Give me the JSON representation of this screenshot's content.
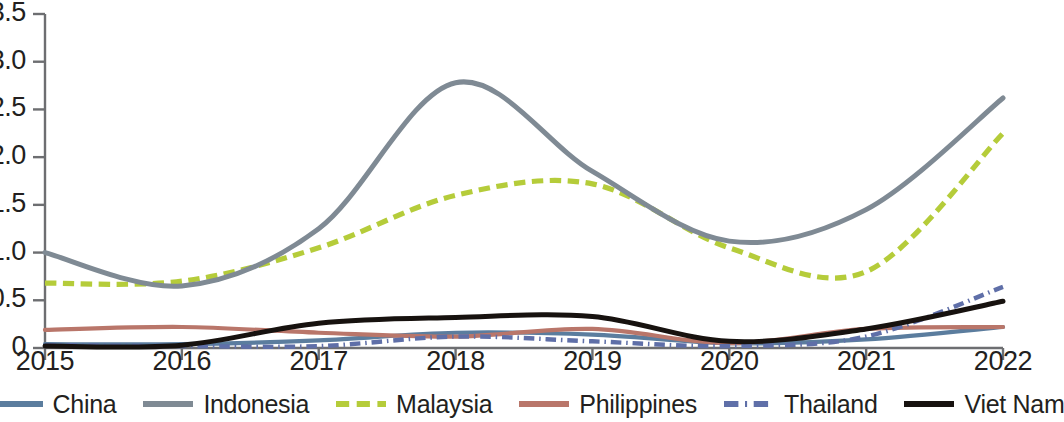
{
  "chart_data": {
    "type": "line",
    "title": "",
    "subtitle": "",
    "xlabel": "",
    "ylabel": "",
    "x": [
      2015,
      2016,
      2017,
      2018,
      2019,
      2020,
      2021,
      2022
    ],
    "xlim": [
      2015,
      2022
    ],
    "ylim": [
      0,
      3.5
    ],
    "yticks": [
      0,
      0.5,
      1.0,
      1.5,
      2.0,
      2.5,
      3.0,
      3.5
    ],
    "ytick_labels": [
      "0",
      "0.5",
      "1.0",
      "1.5",
      "2.0",
      "2.5",
      "3.0",
      "3.5"
    ],
    "xticks": [
      2015,
      2016,
      2017,
      2018,
      2019,
      2020,
      2021,
      2022
    ],
    "xtick_labels": [
      "2015",
      "2016",
      "2017",
      "2018",
      "2019",
      "2020",
      "2021",
      "2022"
    ],
    "grid": false,
    "legend_position": "bottom",
    "series": [
      {
        "name": "China",
        "color": "#5b7d9e",
        "style": "solid",
        "values": [
          0.04,
          0.04,
          0.08,
          0.16,
          0.14,
          0.05,
          0.09,
          0.22
        ]
      },
      {
        "name": "Indonesia",
        "color": "#7f8a94",
        "style": "solid",
        "values": [
          1.0,
          0.65,
          1.25,
          2.78,
          1.85,
          1.12,
          1.45,
          2.62
        ]
      },
      {
        "name": "Malaysia",
        "color": "#b5cc3a",
        "style": "dashed",
        "values": [
          0.68,
          0.7,
          1.05,
          1.6,
          1.72,
          1.05,
          0.8,
          2.25
        ]
      },
      {
        "name": "Philippines",
        "color": "#b9766a",
        "style": "solid",
        "values": [
          0.19,
          0.22,
          0.16,
          0.12,
          0.2,
          0.05,
          0.2,
          0.22
        ]
      },
      {
        "name": "Thailand",
        "color": "#5f6fa8",
        "style": "dashdot",
        "values": [
          0.03,
          0.02,
          0.02,
          0.12,
          0.07,
          0.02,
          0.12,
          0.64
        ]
      },
      {
        "name": "Viet Nam",
        "color": "#17120f",
        "style": "solid",
        "values": [
          0.02,
          0.03,
          0.26,
          0.32,
          0.33,
          0.07,
          0.2,
          0.49
        ]
      }
    ]
  },
  "axes": {
    "y_ticks": [
      {
        "label": "3.5",
        "value": 3.5
      },
      {
        "label": "3.0",
        "value": 3.0
      },
      {
        "label": "2.5",
        "value": 2.5
      },
      {
        "label": "2.0",
        "value": 2.0
      },
      {
        "label": "1.5",
        "value": 1.5
      },
      {
        "label": "1.0",
        "value": 1.0
      },
      {
        "label": "0.5",
        "value": 0.5
      },
      {
        "label": "0",
        "value": 0
      }
    ],
    "x_ticks": [
      {
        "label": "2015",
        "value": 2015
      },
      {
        "label": "2016",
        "value": 2016
      },
      {
        "label": "2017",
        "value": 2017
      },
      {
        "label": "2018",
        "value": 2018
      },
      {
        "label": "2019",
        "value": 2019
      },
      {
        "label": "2020",
        "value": 2020
      },
      {
        "label": "2021",
        "value": 2021
      },
      {
        "label": "2022",
        "value": 2022
      }
    ]
  },
  "legend": {
    "items": [
      {
        "label": "China",
        "color": "#5b7d9e",
        "style": "solid"
      },
      {
        "label": "Indonesia",
        "color": "#7f8a94",
        "style": "solid"
      },
      {
        "label": "Malaysia",
        "color": "#b5cc3a",
        "style": "dashed"
      },
      {
        "label": "Philippines",
        "color": "#b9766a",
        "style": "solid"
      },
      {
        "label": "Thailand",
        "color": "#5f6fa8",
        "style": "dashdot"
      },
      {
        "label": "Viet Nam",
        "color": "#17120f",
        "style": "solid"
      }
    ]
  }
}
